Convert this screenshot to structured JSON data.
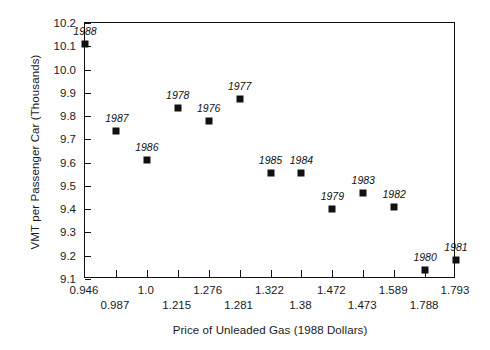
{
  "chart_data": {
    "type": "scatter",
    "title": "",
    "xlabel": "Price of Unleaded Gas (1988 Dollars)",
    "ylabel": "VMT per Passenger Car (Thousands)",
    "grid": false,
    "legend": "none",
    "ylim": [
      9.1,
      10.2
    ],
    "yticks": [
      "10.2",
      "10.1",
      "10.0",
      "9.9",
      "9.8",
      "9.7",
      "9.6",
      "9.5",
      "9.4",
      "9.3",
      "9.2",
      "9.1"
    ],
    "ytick_values": [
      10.2,
      10.1,
      10.0,
      9.9,
      9.8,
      9.7,
      9.6,
      9.5,
      9.4,
      9.3,
      9.2,
      9.1
    ],
    "x_axis_kind": "ordinal-price-categories",
    "xticks": [
      "0.946",
      "0.987",
      "1.0",
      "1.215",
      "1.276",
      "1.281",
      "1.322",
      "1.38",
      "1.472",
      "1.473",
      "1.589",
      "1.788",
      "1.793"
    ],
    "xtick_rows": [
      0,
      1,
      0,
      1,
      0,
      1,
      0,
      1,
      0,
      1,
      0,
      1,
      0
    ],
    "point_labels": [
      "1988",
      "1987",
      "1986",
      "1978",
      "1976",
      "1977",
      "1985",
      "1984",
      "1979",
      "1983",
      "1982",
      "1980",
      "1981"
    ],
    "x": [
      0.946,
      0.987,
      1.0,
      1.215,
      1.276,
      1.281,
      1.322,
      1.38,
      1.472,
      1.473,
      1.589,
      1.788,
      1.793
    ],
    "values": [
      10.11,
      9.735,
      9.61,
      9.835,
      9.78,
      9.875,
      9.555,
      9.555,
      9.4,
      9.47,
      9.41,
      9.14,
      9.18
    ],
    "points": [
      {
        "label": "1988",
        "x": 0.946,
        "y": 10.11,
        "slot": 0,
        "label_pos": "above"
      },
      {
        "label": "1987",
        "x": 0.987,
        "y": 9.735,
        "slot": 1,
        "label_pos": "above-left"
      },
      {
        "label": "1986",
        "x": 1.0,
        "y": 9.61,
        "slot": 2,
        "label_pos": "above"
      },
      {
        "label": "1978",
        "x": 1.215,
        "y": 9.835,
        "slot": 3,
        "label_pos": "above"
      },
      {
        "label": "1976",
        "x": 1.276,
        "y": 9.78,
        "slot": 4,
        "label_pos": "above"
      },
      {
        "label": "1977",
        "x": 1.281,
        "y": 9.875,
        "slot": 5,
        "label_pos": "above"
      },
      {
        "label": "1985",
        "x": 1.322,
        "y": 9.555,
        "slot": 6,
        "label_pos": "above"
      },
      {
        "label": "1984",
        "x": 1.38,
        "y": 9.555,
        "slot": 7,
        "label_pos": "above"
      },
      {
        "label": "1979",
        "x": 1.472,
        "y": 9.4,
        "slot": 8,
        "label_pos": "above"
      },
      {
        "label": "1983",
        "x": 1.473,
        "y": 9.47,
        "slot": 9,
        "label_pos": "above"
      },
      {
        "label": "1982",
        "x": 1.589,
        "y": 9.41,
        "slot": 10,
        "label_pos": "above"
      },
      {
        "label": "1980",
        "x": 1.788,
        "y": 9.14,
        "slot": 11,
        "label_pos": "above"
      },
      {
        "label": "1981",
        "x": 1.793,
        "y": 9.18,
        "slot": 12,
        "label_pos": "above"
      }
    ],
    "marker_color": "#111111",
    "axis_color": "#111111",
    "background_color": "#ffffff"
  }
}
